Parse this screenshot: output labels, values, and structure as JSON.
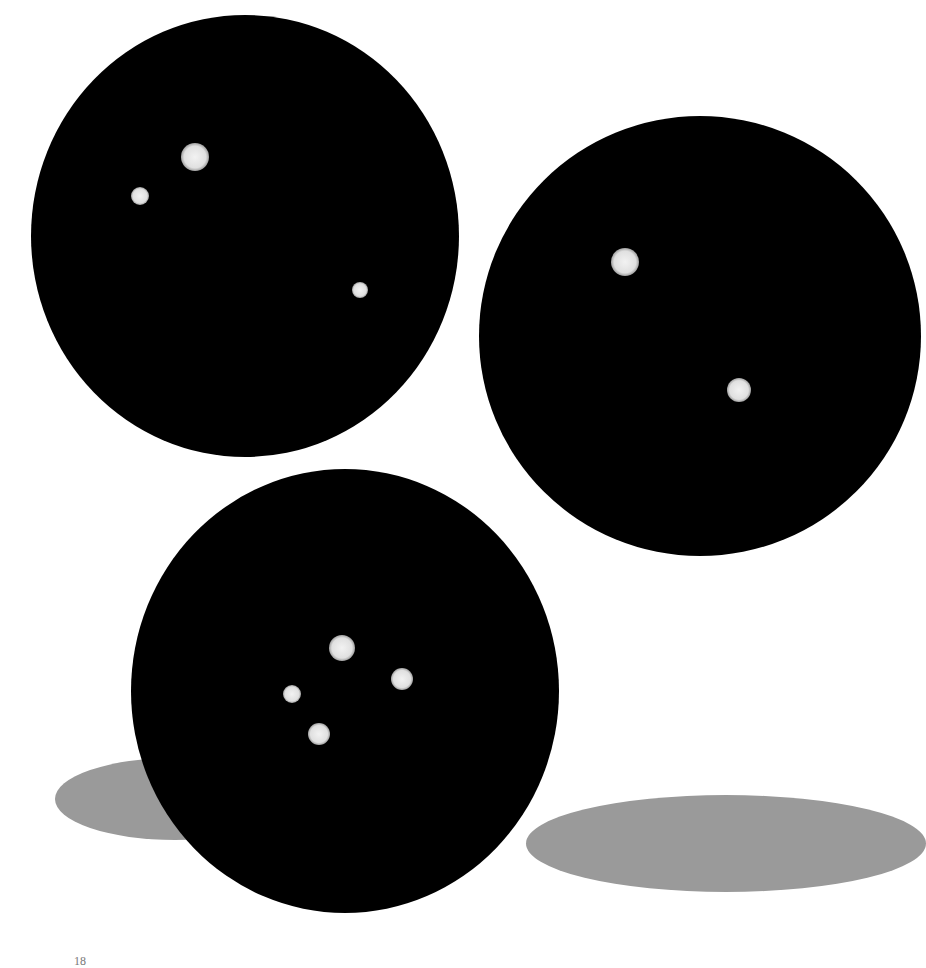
{
  "page": {
    "background": "#ffffff",
    "page_number": "18"
  },
  "colors": {
    "disc": "#000000",
    "shadow": "#9a9a9a",
    "star": "#efefef"
  },
  "figures": [
    {
      "name": "disc-top-left",
      "cx": 245,
      "cy": 236,
      "rx": 214,
      "ry": 221,
      "stars": [
        {
          "x": 195,
          "y": 157,
          "r": 14
        },
        {
          "x": 140,
          "y": 196,
          "r": 9
        },
        {
          "x": 360,
          "y": 290,
          "r": 8
        }
      ]
    },
    {
      "name": "disc-right",
      "cx": 700,
      "cy": 336,
      "rx": 221,
      "ry": 220,
      "stars": [
        {
          "x": 625,
          "y": 262,
          "r": 14
        },
        {
          "x": 739,
          "y": 390,
          "r": 12
        }
      ]
    },
    {
      "name": "disc-bottom",
      "cx": 345,
      "cy": 691,
      "rx": 214,
      "ry": 222,
      "stars": [
        {
          "x": 342,
          "y": 648,
          "r": 13
        },
        {
          "x": 402,
          "y": 679,
          "r": 11
        },
        {
          "x": 292,
          "y": 694,
          "r": 9
        },
        {
          "x": 319,
          "y": 734,
          "r": 11
        }
      ]
    }
  ],
  "shadows": [
    {
      "name": "shadow-left",
      "left": 55,
      "top": 758,
      "width": 240,
      "height": 82
    },
    {
      "name": "shadow-right",
      "left": 526,
      "top": 795,
      "width": 400,
      "height": 97
    }
  ]
}
